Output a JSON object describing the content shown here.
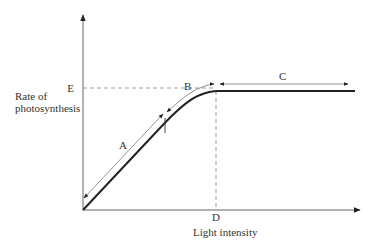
{
  "diagram": {
    "y_axis_label_line1": "Rate of",
    "y_axis_label_line2": "photosynthesis",
    "x_axis_label": "Light intensity",
    "point_labels": {
      "E": "E",
      "D": "D",
      "A": "A",
      "B": "B",
      "C": "C"
    },
    "regions": [
      {
        "label": "A",
        "description": "linear rise, light limiting"
      },
      {
        "label": "B",
        "description": "curve levelling off"
      },
      {
        "label": "C",
        "description": "plateau, light saturation"
      }
    ],
    "colors": {
      "curve": "#222222",
      "axes": "#555555",
      "guides": "#888888"
    }
  }
}
